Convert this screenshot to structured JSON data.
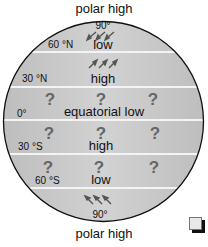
{
  "diagram": {
    "title_top": "polar high",
    "title_bottom": "polar high",
    "colors": {
      "band": "#c8c8c8",
      "divider": "#f4f4f4",
      "outline": "#111111",
      "text": "#111111",
      "arrow": "#555555"
    },
    "bands": [
      {
        "lat_label": "90°",
        "pressure": "low",
        "side_label": "60 °N",
        "arrows": "south-west"
      },
      {
        "lat_label": "",
        "pressure": "high",
        "side_label": "30 °N",
        "arrows": "north-east"
      },
      {
        "lat_label": "",
        "pressure": "equatorial low",
        "side_label": "0°",
        "unknown": [
          "?",
          "?",
          "?"
        ]
      },
      {
        "lat_label": "",
        "pressure": "high",
        "side_label": "30 °S",
        "unknown": [
          "?",
          "?",
          "?"
        ]
      },
      {
        "lat_label": "",
        "pressure": "low",
        "side_label": "60 °S",
        "unknown": [
          "?",
          "?",
          "?"
        ]
      },
      {
        "lat_label": "90°",
        "pressure": "",
        "side_label": "",
        "arrows": "north-west"
      }
    ],
    "corner_icon": "copy-icon"
  }
}
